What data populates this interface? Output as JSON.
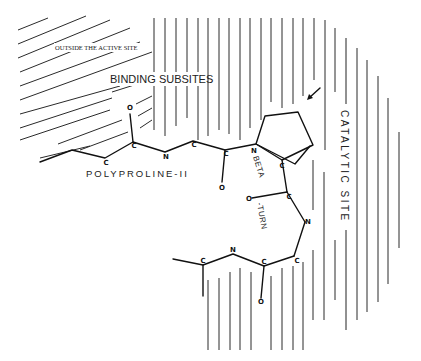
{
  "diagram": {
    "regions": {
      "outside": "OUTSIDE THE ACTIVE SITE",
      "binding": "BINDING SUBSITES",
      "catalytic": "CATALYTIC SITE"
    },
    "conformations": {
      "polyproline": "POLYPROLINE-II",
      "beta_part1": "BETA",
      "beta_part2": "-TURN"
    },
    "atoms": {
      "c": "C",
      "n": "N",
      "o": "O"
    },
    "icons": {
      "pointer_arrow": "arrow-pointing-down-left"
    },
    "colors": {
      "ink": "#111111",
      "background": "#ffffff"
    }
  }
}
